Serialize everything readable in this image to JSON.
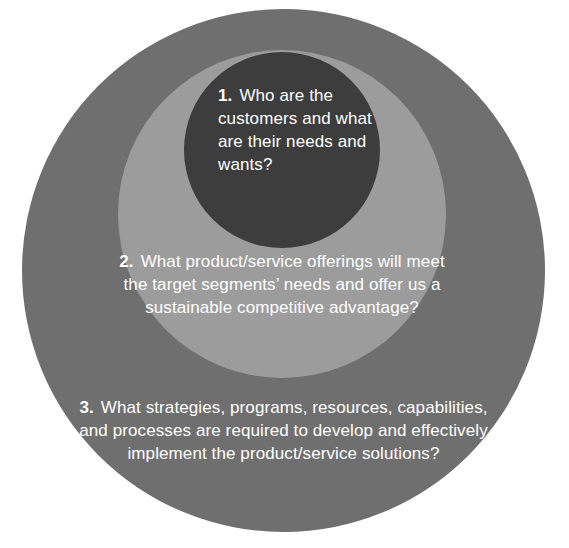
{
  "diagram": {
    "type": "concentric-circles",
    "background_color": "#ffffff",
    "levels": [
      {
        "id": "inner",
        "ring": "inner-circle",
        "color": "#3d3d3d",
        "number": "1.",
        "text": "Who are the customers and what are their needs and wants?"
      },
      {
        "id": "middle",
        "ring": "middle-circle",
        "color": "#9c9c9c",
        "number": "2.",
        "text": "What product/service offerings will meet the target segments’ needs and offer us a sustainable competitive advantage?"
      },
      {
        "id": "outer",
        "ring": "outer-circle",
        "color": "#6f6f6f",
        "number": "3.",
        "text": "What strategies, programs, resources, capabilities, and processes are required to develop and effectively implement the product/service solutions?"
      }
    ],
    "text_color": "#ffffff"
  }
}
